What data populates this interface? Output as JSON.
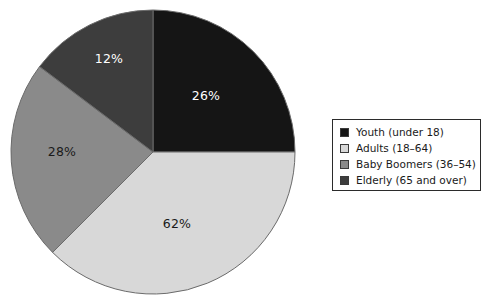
{
  "chart_data": {
    "type": "pie",
    "title": "",
    "subtitle": "",
    "xlabel": "",
    "ylabel": "",
    "legend_position": "right",
    "grid": false,
    "categories": [
      "Youth (under 18)",
      "Adults (18–64)",
      "Baby Boomers (36–54)",
      "Elderly (65 and over)"
    ],
    "values": [
      26,
      62,
      28,
      12
    ],
    "value_labels": [
      "26%",
      "62%",
      "28%",
      "12%"
    ],
    "colors": [
      "#151515",
      "#d8d8d8",
      "#8a8a8a",
      "#3d3d3d"
    ],
    "slices": [
      {
        "label": "Youth (under 18)",
        "value": 26,
        "value_label": "26%",
        "color": "#151515",
        "label_color": "#ffffff",
        "start_angle": 0,
        "end_angle": 90,
        "label_x": 206,
        "label_y": 96
      },
      {
        "label": "Adults (18–64)",
        "value": 62,
        "value_label": "62%",
        "color": "#d8d8d8",
        "label_color": "#1a1a1a",
        "start_angle": 90,
        "end_angle": 225,
        "label_x": 177,
        "label_y": 224
      },
      {
        "label": "Baby Boomers (36–54)",
        "value": 28,
        "value_label": "28%",
        "color": "#8a8a8a",
        "label_color": "#1a1a1a",
        "start_angle": 225,
        "end_angle": 307,
        "label_x": 62,
        "label_y": 152
      },
      {
        "label": "Elderly (65 and over)",
        "value": 12,
        "value_label": "12%",
        "color": "#3d3d3d",
        "label_color": "#ffffff",
        "start_angle": 307,
        "end_angle": 360,
        "label_x": 109,
        "label_y": 59
      }
    ],
    "geometry": {
      "center_x": 153,
      "center_y": 152,
      "radius": 142,
      "outline_color": "#6b6b6b"
    }
  },
  "legend": {
    "border_color": "#2b2b2b",
    "background": "#ffffff",
    "items": [
      {
        "label": "Youth (under 18)",
        "color": "#151515"
      },
      {
        "label": "Adults (18–64)",
        "color": "#d8d8d8"
      },
      {
        "label": "Baby Boomers (36–54)",
        "color": "#8a8a8a"
      },
      {
        "label": "Elderly (65 and over)",
        "color": "#3d3d3d"
      }
    ]
  }
}
